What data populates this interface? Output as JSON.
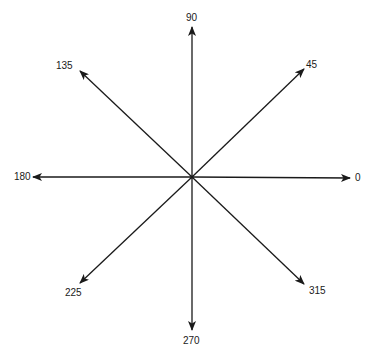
{
  "diagram": {
    "title": "",
    "type": "compass-rose-directions",
    "center": {
      "x": 192,
      "y": 177
    },
    "line_color": "#1a1a1a",
    "text_color": "#1a1a1a",
    "background": "#ffffff",
    "arrows": [
      {
        "angle": "0",
        "label": "0",
        "tip": {
          "x": 350,
          "y": 178
        },
        "label_pos": {
          "x": 355,
          "y": 173
        }
      },
      {
        "angle": "45",
        "label": "45",
        "tip": {
          "x": 304,
          "y": 69
        },
        "label_pos": {
          "x": 306,
          "y": 60
        }
      },
      {
        "angle": "90",
        "label": "90",
        "tip": {
          "x": 192,
          "y": 27
        },
        "label_pos": {
          "x": 186,
          "y": 13
        }
      },
      {
        "angle": "135",
        "label": "135",
        "tip": {
          "x": 80,
          "y": 71
        },
        "label_pos": {
          "x": 56,
          "y": 61
        }
      },
      {
        "angle": "180",
        "label": "180",
        "tip": {
          "x": 33,
          "y": 177
        },
        "label_pos": {
          "x": 14,
          "y": 172
        }
      },
      {
        "angle": "225",
        "label": "225",
        "tip": {
          "x": 80,
          "y": 283
        },
        "label_pos": {
          "x": 65,
          "y": 288
        }
      },
      {
        "angle": "270",
        "label": "270",
        "tip": {
          "x": 192,
          "y": 330
        },
        "label_pos": {
          "x": 183,
          "y": 336
        }
      },
      {
        "angle": "315",
        "label": "315",
        "tip": {
          "x": 304,
          "y": 284
        },
        "label_pos": {
          "x": 309,
          "y": 286
        }
      }
    ]
  }
}
